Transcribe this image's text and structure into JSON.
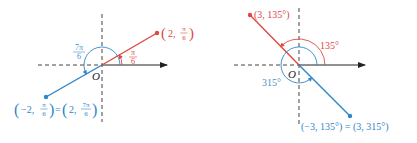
{
  "colors": {
    "red": "#e0473f",
    "blue": "#2f86c9",
    "axis": "#333333",
    "label_blue": "#4a8fc7"
  },
  "left_diagram": {
    "origin_label": "O",
    "red_point": {
      "r": "2",
      "theta_num": "π",
      "theta_den": "6",
      "label": "(2, π/6)"
    },
    "red_angle": {
      "num": "π",
      "den": "6"
    },
    "blue_angle": {
      "num": "7π",
      "den": "6"
    },
    "blue_point": {
      "label": "(−2, π/6) = (2, 7π/6)",
      "lhs_r": "−2,",
      "lhs_num": "π",
      "lhs_den": "6",
      "eq": "=",
      "rhs_r": "2,",
      "rhs_num": "7π",
      "rhs_den": "6"
    }
  },
  "right_diagram": {
    "origin_label": "O",
    "red_point": {
      "label": "(3, 135°)"
    },
    "red_angle": {
      "label": "135°"
    },
    "blue_angle": {
      "label": "315°"
    },
    "blue_point": {
      "label": "(−3, 135°) = (3, 315°)"
    }
  }
}
